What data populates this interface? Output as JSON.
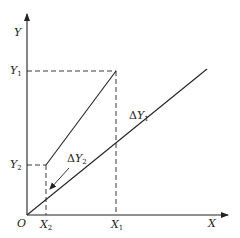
{
  "diagram": {
    "axes": {
      "x_label": "X",
      "y_label": "Y",
      "origin_label": "O"
    },
    "ticks": {
      "y1": {
        "base": "Y",
        "sub": "1"
      },
      "y2": {
        "base": "Y",
        "sub": "2"
      },
      "x1": {
        "base": "X",
        "sub": "1"
      },
      "x2": {
        "base": "X",
        "sub": "2"
      }
    },
    "annotations": {
      "delta_y1": {
        "delta": "Δ",
        "base": "Y",
        "sub": "1"
      },
      "delta_y2": {
        "delta": "Δ",
        "base": "Y",
        "sub": "2"
      }
    },
    "colors": {
      "line": "#222222",
      "background": "#ffffff"
    }
  }
}
